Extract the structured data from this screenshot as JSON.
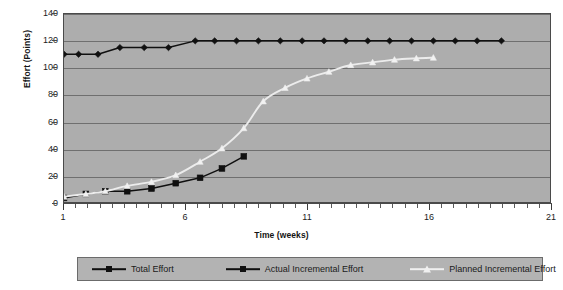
{
  "chart_data": {
    "type": "line",
    "title": "",
    "xlabel": "Time (weeks)",
    "ylabel": "Effort (Points)",
    "xlim": [
      1,
      21
    ],
    "ylim": [
      0,
      140
    ],
    "ytick_labels": [
      "0",
      "20",
      "40",
      "60",
      "80",
      "100",
      "120",
      "140"
    ],
    "ytick_values": [
      0,
      20,
      40,
      60,
      80,
      100,
      120,
      140
    ],
    "xtick_labels": [
      "1",
      "6",
      "11",
      "16",
      "21"
    ],
    "xtick_values": [
      1,
      6,
      11,
      16,
      21
    ],
    "xminor_step": 0.5,
    "grid": "horizontal",
    "legend_position": "bottom",
    "plot_bgcolor": "#adadad",
    "series": [
      {
        "name": "Total Effort",
        "color": "#101010",
        "marker": "diamond",
        "marker_fill": "#101010",
        "x": [
          1,
          1.6,
          2.4,
          3.3,
          4.3,
          5.3,
          6.4,
          7.2,
          8.1,
          9.0,
          9.9,
          10.8,
          11.7,
          12.6,
          13.5,
          14.4,
          15.3,
          16.2,
          17.1,
          18.0,
          19.0
        ],
        "values": [
          110,
          110,
          110,
          115,
          115,
          115,
          120,
          120,
          120,
          120,
          120,
          120,
          120,
          120,
          120,
          120,
          120,
          120,
          120,
          120,
          120
        ]
      },
      {
        "name": "Actual Incremental Effort",
        "color": "#101010",
        "marker": "square",
        "marker_fill": "#101010",
        "x": [
          1,
          1.9,
          2.7,
          3.6,
          4.6,
          5.6,
          6.6,
          7.5,
          8.4
        ],
        "values": [
          3,
          6,
          8,
          8,
          10,
          14,
          18,
          25,
          34
        ]
      },
      {
        "name": "Planned Incremental Effort",
        "color": "#ececec",
        "marker": "triangle",
        "marker_fill": "#f2f2f2",
        "x": [
          1,
          1.9,
          2.7,
          3.6,
          4.6,
          5.6,
          6.6,
          7.5,
          8.4,
          9.2,
          10.1,
          11.0,
          11.9,
          12.8,
          13.7,
          14.6,
          15.5,
          16.2
        ],
        "values": [
          4,
          6,
          8,
          12,
          15,
          20,
          30,
          40,
          55,
          75,
          85,
          92,
          97,
          102,
          104,
          106,
          107,
          107.5
        ]
      }
    ]
  },
  "axis": {
    "y_title": "Effort (Points)",
    "x_title": "Time (weeks)"
  },
  "legend": {
    "items": [
      {
        "label": "Total Effort",
        "marker": "diamond",
        "color": "#101010"
      },
      {
        "label": "Actual Incremental Effort",
        "marker": "square",
        "color": "#101010"
      },
      {
        "label": "Planned Incremental Effort",
        "marker": "triangle",
        "color": "#f0f0f0"
      }
    ]
  }
}
